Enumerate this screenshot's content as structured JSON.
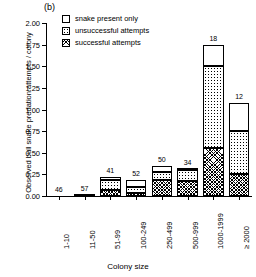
{
  "panel": {
    "label": "(b)"
  },
  "legend": {
    "items": [
      {
        "key": "present",
        "label": "snake present only",
        "swatch": "white-square-icon"
      },
      {
        "key": "unsuccessful",
        "label": "unsuccessful attempts",
        "swatch": "dotted-square-icon"
      },
      {
        "key": "successful",
        "label": "successful attempts",
        "swatch": "hatched-square-icon"
      }
    ]
  },
  "chart_data": {
    "type": "bar",
    "title": "",
    "xlabel": "Colony size",
    "ylabel": "Observed bull snake predation attempts / colony",
    "ylim": [
      0,
      2.0
    ],
    "yticks": [
      "0.00",
      "0.25",
      "0.50",
      "0.75",
      "1.00",
      "1.25",
      "1.50",
      "1.75",
      "2.00"
    ],
    "ytick_values": [
      0,
      0.25,
      0.5,
      0.75,
      1.0,
      1.25,
      1.5,
      1.75,
      2.0
    ],
    "grid": false,
    "legend_position": "top-left",
    "stacked": true,
    "categories": [
      "1-10",
      "11-50",
      "51-99",
      "100-249",
      "250-499",
      "500-999",
      "1000-1999",
      "≥ 2000"
    ],
    "sample_sizes": [
      46,
      57,
      41,
      52,
      50,
      34,
      18,
      12
    ],
    "series": [
      {
        "name": "successful attempts",
        "values": [
          0.0,
          0.01,
          0.07,
          0.03,
          0.19,
          0.17,
          0.55,
          0.26
        ]
      },
      {
        "name": "unsuccessful attempts",
        "values": [
          0.0,
          0.0,
          0.11,
          0.07,
          0.09,
          0.13,
          0.95,
          0.49
        ]
      },
      {
        "name": "snake present only",
        "values": [
          0.0,
          0.0,
          0.04,
          0.09,
          0.07,
          0.01,
          0.25,
          0.33
        ]
      }
    ],
    "totals": [
      0.0,
      0.01,
      0.22,
      0.19,
      0.35,
      0.31,
      1.75,
      1.08
    ]
  }
}
